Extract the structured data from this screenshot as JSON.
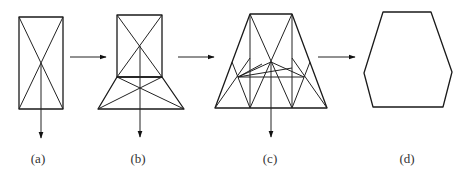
{
  "figure": {
    "panels": [
      {
        "id": "a",
        "label": "(a)",
        "label_x": 38,
        "description": "rectangle with crossed diagonals and downward load arrow"
      },
      {
        "id": "b",
        "label": "(b)",
        "label_x": 138,
        "description": "rectangle with crossed diagonals atop trapezoid with crossed diagonals and downward load arrow"
      },
      {
        "id": "c",
        "label": "(c)",
        "label_x": 270,
        "description": "trapezoid truss with internal verticals, diagonals, horizontal member and fan bracing, downward load arrow"
      },
      {
        "id": "d",
        "label": "(d)",
        "label_x": 407,
        "description": "hexagon outline"
      }
    ],
    "transition_arrows": [
      {
        "from": "a",
        "to": "b"
      },
      {
        "from": "b",
        "to": "c"
      },
      {
        "from": "c",
        "to": "d"
      }
    ],
    "colors": {
      "line": "#1a1a1a",
      "label": "#333333",
      "background": "#ffffff"
    }
  }
}
